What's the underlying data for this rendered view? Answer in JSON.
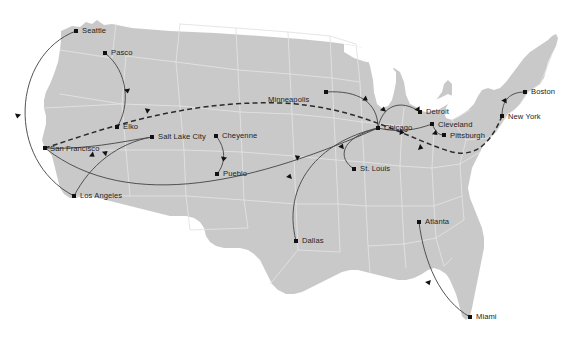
{
  "map": {
    "title": "United States route map",
    "projection_note": "continental United States",
    "colors": {
      "land": "#c9c9c9",
      "state_border": "#e2e2e2",
      "background": "#ffffff",
      "route_solid": "#4a4a4a",
      "route_dashed": "#2b2b2b",
      "city_dot": "#111111",
      "label_text": "#242424"
    },
    "cities": [
      {
        "id": "seattle",
        "name": "Seattle",
        "x": 76,
        "y": 31,
        "label_dx": 6,
        "label_dy": -4
      },
      {
        "id": "pasco",
        "name": "Pasco",
        "x": 105,
        "y": 53,
        "label_dx": 6,
        "label_dy": -4
      },
      {
        "id": "san-francisco",
        "name": "San Francisco",
        "x": 45,
        "y": 148,
        "label_dx": 5,
        "label_dy": -3
      },
      {
        "id": "los-angeles",
        "name": "Los Angeles",
        "x": 74,
        "y": 196,
        "label_dx": 6,
        "label_dy": -4
      },
      {
        "id": "elko",
        "name": "Elko",
        "x": 117,
        "y": 127,
        "label_dx": 6,
        "label_dy": -4
      },
      {
        "id": "salt-lake-city",
        "name": "Salt Lake City",
        "x": 152,
        "y": 137,
        "label_dx": 6,
        "label_dy": -4
      },
      {
        "id": "cheyenne",
        "name": "Cheyenne",
        "x": 216,
        "y": 136,
        "label_dx": 6,
        "label_dy": -4
      },
      {
        "id": "pueblo",
        "name": "Pueblo",
        "x": 217,
        "y": 174,
        "label_dx": 6,
        "label_dy": -4
      },
      {
        "id": "dallas",
        "name": "Dallas",
        "x": 296,
        "y": 241,
        "label_dx": 6,
        "label_dy": -4
      },
      {
        "id": "minneapolis",
        "name": "Minneapolis",
        "x": 326,
        "y": 92,
        "label_dx": -58,
        "label_dy": 4
      },
      {
        "id": "st-louis",
        "name": "St. Louis",
        "x": 354,
        "y": 169,
        "label_dx": 6,
        "label_dy": -4
      },
      {
        "id": "chicago",
        "name": "Chicago",
        "x": 378,
        "y": 128,
        "label_dx": 6,
        "label_dy": -4
      },
      {
        "id": "detroit",
        "name": "Detroit",
        "x": 420,
        "y": 112,
        "label_dx": 6,
        "label_dy": -4
      },
      {
        "id": "cleveland",
        "name": "Cleveland",
        "x": 432,
        "y": 124,
        "label_dx": 6,
        "label_dy": -3
      },
      {
        "id": "pittsburgh",
        "name": "Pittsburgh",
        "x": 444,
        "y": 135,
        "label_dx": 6,
        "label_dy": -3
      },
      {
        "id": "new-york",
        "name": "New York",
        "x": 502,
        "y": 116,
        "label_dx": 6,
        "label_dy": -3
      },
      {
        "id": "boston",
        "name": "Boston",
        "x": 525,
        "y": 92,
        "label_dx": 6,
        "label_dy": -4
      },
      {
        "id": "atlanta",
        "name": "Atlanta",
        "x": 419,
        "y": 222,
        "label_dx": 6,
        "label_dy": -4
      },
      {
        "id": "miami",
        "name": "Miami",
        "x": 470,
        "y": 317,
        "label_dx": 6,
        "label_dy": -4
      }
    ],
    "routes": [
      {
        "id": "seattle-los-angeles",
        "from": "seattle",
        "to": "los-angeles",
        "style": "solid",
        "path": "M 76 31 C 12 55 5 160 74 196",
        "arrows": [
          {
            "x": 18,
            "y": 114,
            "angle": 100
          }
        ]
      },
      {
        "id": "pasco-elko",
        "from": "pasco",
        "to": "elko",
        "style": "solid",
        "path": "M 105 53 C 129 72 130 107 117 127",
        "arrows": [
          {
            "x": 127,
            "y": 89,
            "angle": 80
          }
        ]
      },
      {
        "id": "san-francisco-salt-lake",
        "from": "san-francisco",
        "to": "salt-lake-city",
        "style": "solid",
        "path": "M 45 148 C 85 150 120 142 152 137",
        "arrows": []
      },
      {
        "id": "los-angeles-salt-lake",
        "from": "los-angeles",
        "to": "salt-lake-city",
        "style": "solid",
        "path": "M 74 196 C 90 165 118 143 152 137",
        "arrows": [
          {
            "x": 104,
            "y": 154,
            "angle": -40
          }
        ]
      },
      {
        "id": "cheyenne-pueblo",
        "from": "cheyenne",
        "to": "pueblo",
        "style": "solid",
        "path": "M 216 136 C 226 148 226 163 217 174",
        "arrows": [
          {
            "x": 224,
            "y": 157,
            "angle": 100
          }
        ]
      },
      {
        "id": "san-francisco-chicago",
        "from": "san-francisco",
        "to": "chicago",
        "style": "solid",
        "path": "M 45 148 C 130 215 260 180 378 128",
        "arrows": [
          {
            "x": 91,
            "y": 154,
            "angle": 38
          },
          {
            "x": 296,
            "y": 158,
            "angle": -25
          }
        ]
      },
      {
        "id": "dallas-chicago",
        "from": "dallas",
        "to": "chicago",
        "style": "solid",
        "path": "M 296 241 C 282 185 318 142 378 128",
        "arrows": [
          {
            "x": 289,
            "y": 178,
            "angle": -72
          }
        ]
      },
      {
        "id": "st-louis-chicago",
        "from": "st-louis",
        "to": "chicago",
        "style": "solid",
        "path": "M 354 169 C 337 158 340 138 378 128",
        "arrows": [
          {
            "x": 341,
            "y": 148,
            "angle": -65
          }
        ]
      },
      {
        "id": "minneapolis-chicago",
        "from": "minneapolis",
        "to": "chicago",
        "style": "solid",
        "path": "M 326 92 C 358 90 378 102 378 128",
        "arrows": [
          {
            "x": 364,
            "y": 98,
            "angle": 34
          }
        ]
      },
      {
        "id": "chicago-detroit",
        "from": "chicago",
        "to": "detroit",
        "style": "solid",
        "path": "M 378 128 C 382 106 400 98 420 112",
        "arrows": [
          {
            "x": 417,
            "y": 108,
            "angle": 56
          },
          {
            "x": 383,
            "y": 111,
            "angle": -78
          }
        ]
      },
      {
        "id": "chicago-cleveland",
        "from": "chicago",
        "to": "cleveland",
        "style": "solid",
        "path": "M 378 128 C 398 133 416 130 432 124",
        "arrows": [
          {
            "x": 400,
            "y": 132,
            "angle": 10
          }
        ]
      },
      {
        "id": "cleveland-pittsburgh",
        "from": "cleveland",
        "to": "pittsburgh",
        "style": "solid",
        "path": "M 432 124 C 436 132 438 135 444 135",
        "arrows": [
          {
            "x": 434,
            "y": 132,
            "angle": 40
          }
        ]
      },
      {
        "id": "new-york-boston",
        "from": "new-york",
        "to": "boston",
        "style": "solid",
        "path": "M 502 116 C 502 100 510 92 525 92",
        "arrows": [
          {
            "x": 504,
            "y": 102,
            "angle": -62
          }
        ]
      },
      {
        "id": "atlanta-miami",
        "from": "atlanta",
        "to": "miami",
        "style": "solid",
        "path": "M 419 222 C 424 262 440 300 470 317",
        "arrows": [
          {
            "x": 428,
            "y": 281,
            "angle": 70
          }
        ]
      },
      {
        "id": "transcontinental-dashed",
        "from": "san-francisco",
        "to": "new-york",
        "style": "dashed",
        "path": "M 45 148 C 95 132 180 100 280 103 C 360 106 410 140 452 152 C 478 158 492 140 502 116",
        "arrows": [
          {
            "x": 146,
            "y": 111,
            "angle": -22
          },
          {
            "x": 419,
            "y": 147,
            "angle": 20
          }
        ]
      }
    ]
  }
}
